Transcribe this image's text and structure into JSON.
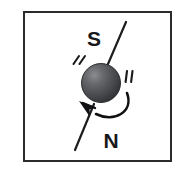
{
  "figure": {
    "canvas": {
      "width": 184,
      "height": 174
    },
    "background_color": "#ffffff"
  },
  "frame": {
    "name": "outer-border",
    "x": 23,
    "y": 11,
    "width": 149,
    "height": 151,
    "stroke_color": "#2b2b2d",
    "stroke_width": 2,
    "fill_color": "#ffffff"
  },
  "labels": {
    "south_pole": "S",
    "north_pole": "N",
    "south_pos": {
      "x": 94,
      "y": 46
    },
    "north_pos": {
      "x": 111,
      "y": 148
    },
    "font_size": 21,
    "color": "#18181a"
  },
  "sphere": {
    "name": "particle-sphere",
    "cx": 101,
    "cy": 83,
    "r": 19.5,
    "base_color": "#4a4a4d",
    "highlight_color": "#7a7a7e",
    "shadow_color": "#2c2c2f",
    "outline_color": "#232326",
    "highlight_offset": {
      "x": -7,
      "y": -8
    }
  },
  "spin_axis": {
    "name": "spin-axis-line",
    "color": "#1d1d1f",
    "stroke_width": 2.2,
    "upper_segment": {
      "x1": 126,
      "y1": 22,
      "x2": 108,
      "y2": 64
    },
    "lower_segment": {
      "x1": 94,
      "y1": 103,
      "x2": 75,
      "y2": 150
    }
  },
  "rotation_arrow": {
    "name": "rotation-curved-arrow",
    "color": "#111113",
    "stroke_width": 2.4,
    "path": "M 128 95 C 133 113, 112 122, 96 114",
    "arrowhead": {
      "tip_x": 80,
      "tip_y": 102,
      "points": "80,102 93,105 89,116"
    },
    "direction": "counterclockwise"
  },
  "motion_marks": {
    "name": "motion-speed-lines",
    "color": "#1a1a1c",
    "left": [
      {
        "x1": 78,
        "y1": 57,
        "x2": 73,
        "y2": 64
      },
      {
        "x1": 84,
        "y1": 57,
        "x2": 79,
        "y2": 64
      }
    ],
    "right": [
      {
        "x1": 127,
        "y1": 72,
        "x2": 126,
        "y2": 82
      },
      {
        "x1": 132,
        "y1": 72,
        "x2": 131,
        "y2": 82
      }
    ]
  }
}
